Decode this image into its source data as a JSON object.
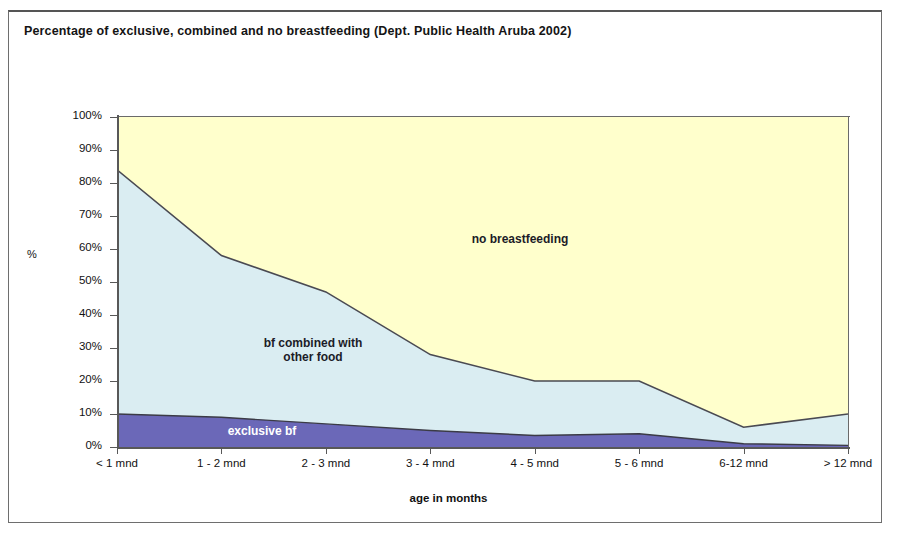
{
  "document": {
    "title": "Percentage of exclusive, combined and no breastfeeding (Dept. Public Health Aruba 2002)"
  },
  "chart_data": {
    "type": "area",
    "stacked": true,
    "title": "Percentage of exclusive, combined and no breastfeeding (Dept. Public Health Aruba 2002)",
    "xlabel": "age in months",
    "ylabel": "%",
    "categories": [
      "< 1 mnd",
      "1 - 2 mnd",
      "2 - 3 mnd",
      "3 - 4 mnd",
      "4 - 5 mnd",
      "5 - 6 mnd",
      "6-12 mnd",
      "> 12 mnd"
    ],
    "ylim": [
      0,
      100
    ],
    "yticks": [
      "0%",
      "10%",
      "20%",
      "30%",
      "40%",
      "50%",
      "60%",
      "70%",
      "80%",
      "90%",
      "100%"
    ],
    "ytick_values": [
      0,
      10,
      20,
      30,
      40,
      50,
      60,
      70,
      80,
      90,
      100
    ],
    "grid": false,
    "legend": "in-plot area labels",
    "series": [
      {
        "name": "exclusive bf",
        "label": "exclusive bf",
        "color": "#6b68b8",
        "values": [
          10,
          9,
          7,
          5,
          3.5,
          4,
          1,
          0.5
        ]
      },
      {
        "name": "bf combined with other food",
        "label": "bf combined with\nother food",
        "color": "#daedf2",
        "values": [
          74,
          49,
          40,
          23,
          16.5,
          16,
          5,
          9.5
        ]
      },
      {
        "name": "no breastfeeding",
        "label": "no breastfeeding",
        "color": "#ffffcc",
        "values": [
          16,
          42,
          53,
          72,
          80,
          80,
          94,
          90
        ]
      }
    ],
    "cumulative_top_of_combined": [
      84,
      58,
      47,
      28,
      20,
      20,
      6,
      10
    ],
    "line_color": "#4a4a52"
  },
  "labels": {
    "no_breastfeeding": "no breastfeeding",
    "combined": "bf combined with\nother food",
    "exclusive": "exclusive bf"
  }
}
